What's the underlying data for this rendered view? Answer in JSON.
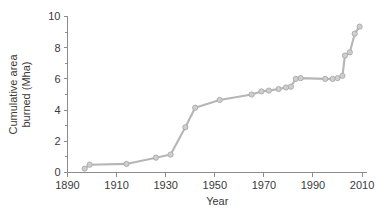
{
  "chart_data": {
    "type": "line",
    "title": "",
    "xlabel": "Year",
    "ylabel": "Cumulative area burned (Mha)",
    "ylabel_line1": "Cumulative area",
    "ylabel_line2": "burned (Mha)",
    "xlim": [
      1890,
      2012
    ],
    "ylim": [
      0,
      10
    ],
    "xticks": [
      1890,
      1910,
      1930,
      1950,
      1970,
      1990,
      2010
    ],
    "xtick_labels": [
      "1890",
      "1910",
      "1930",
      "1950",
      "1970",
      "1990",
      "2010"
    ],
    "yticks": [
      0,
      2,
      4,
      6,
      8,
      10
    ],
    "ytick_labels": [
      "0",
      "2",
      "4",
      "6",
      "8",
      "10"
    ],
    "yticks_minor": [
      1,
      3,
      5,
      7,
      9
    ],
    "grid": false,
    "legend": false,
    "marker": "circle",
    "line_color": "#b6b6b6",
    "marker_fill": "#cfcfcf",
    "marker_edge": "#a8a8a8",
    "axis_color": "#8c8c8c",
    "text_color": "#3a3a3a",
    "background": "#ffffff",
    "x": [
      1897,
      1899,
      1914,
      1926,
      1932,
      1938,
      1942,
      1952,
      1965,
      1969,
      1972,
      1976,
      1979,
      1981,
      1983,
      1985,
      1995,
      1998,
      2000,
      2002,
      2003,
      2005,
      2007,
      2009
    ],
    "values": [
      0.25,
      0.5,
      0.55,
      0.95,
      1.15,
      2.9,
      4.15,
      4.65,
      5.0,
      5.2,
      5.25,
      5.35,
      5.45,
      5.5,
      6.0,
      6.05,
      6.0,
      6.0,
      6.05,
      6.2,
      7.5,
      7.7,
      8.9,
      9.35
    ],
    "points": [
      {
        "year": 1897,
        "value": 0.25
      },
      {
        "year": 1899,
        "value": 0.5
      },
      {
        "year": 1914,
        "value": 0.55
      },
      {
        "year": 1926,
        "value": 0.95
      },
      {
        "year": 1932,
        "value": 1.15
      },
      {
        "year": 1938,
        "value": 2.9
      },
      {
        "year": 1942,
        "value": 4.15
      },
      {
        "year": 1952,
        "value": 4.65
      },
      {
        "year": 1965,
        "value": 5.0
      },
      {
        "year": 1969,
        "value": 5.2
      },
      {
        "year": 1972,
        "value": 5.25
      },
      {
        "year": 1976,
        "value": 5.35
      },
      {
        "year": 1979,
        "value": 5.45
      },
      {
        "year": 1981,
        "value": 5.5
      },
      {
        "year": 1983,
        "value": 6.0
      },
      {
        "year": 1985,
        "value": 6.05
      },
      {
        "year": 1995,
        "value": 6.0
      },
      {
        "year": 1998,
        "value": 6.0
      },
      {
        "year": 2000,
        "value": 6.05
      },
      {
        "year": 2002,
        "value": 6.2
      },
      {
        "year": 2003,
        "value": 7.5
      },
      {
        "year": 2005,
        "value": 7.7
      },
      {
        "year": 2007,
        "value": 8.9
      },
      {
        "year": 2009,
        "value": 9.35
      }
    ]
  }
}
